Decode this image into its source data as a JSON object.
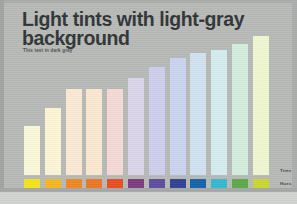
{
  "slide": {
    "title": "Light tints with light-gray background",
    "subtitle": "This text in dark gray",
    "background_color": "#b5b8b5",
    "title_color": "#2f3234",
    "subtitle_color": "#4a4d4f"
  },
  "legend": {
    "tints_label": "Tints",
    "hues_label": "Hues"
  },
  "chart_data": {
    "type": "bar",
    "title": "Light tints with light-gray background",
    "subtitle": "This text in dark gray",
    "xlabel": "",
    "ylabel": "",
    "grid": false,
    "legend_position": "right",
    "ylim": [
      0,
      100
    ],
    "categories": [
      "Yellow",
      "Amber",
      "Orange",
      "Dark Orange",
      "Red Orange",
      "Purple",
      "Violet",
      "Indigo",
      "Blue",
      "Cyan",
      "Green",
      "Yellow Green"
    ],
    "values": [
      35,
      48,
      62,
      62,
      62,
      70,
      78,
      84,
      88,
      90,
      94,
      100
    ],
    "series": [
      {
        "name": "Tints",
        "values": [
          35,
          48,
          62,
          62,
          62,
          70,
          78,
          84,
          88,
          90,
          94,
          100
        ],
        "colors": [
          "#f7f7d8",
          "#fbf3d4",
          "#f9e8d2",
          "#fae6cf",
          "#f4d8d4",
          "#d9d4e8",
          "#cdcdec",
          "#c9d2ee",
          "#cfe0ef",
          "#d2ecee",
          "#d2ecdb",
          "#eef5cf"
        ]
      },
      {
        "name": "Hues",
        "values": [
          10,
          10,
          10,
          10,
          10,
          10,
          10,
          10,
          10,
          10,
          10,
          10
        ],
        "colors": [
          "#f2e216",
          "#f5b41b",
          "#ef8520",
          "#ed7420",
          "#e94b1c",
          "#7b3a7e",
          "#5b4a9e",
          "#2e3f94",
          "#1161a8",
          "#2fb7cf",
          "#56a846",
          "#c9d62a"
        ]
      }
    ]
  }
}
